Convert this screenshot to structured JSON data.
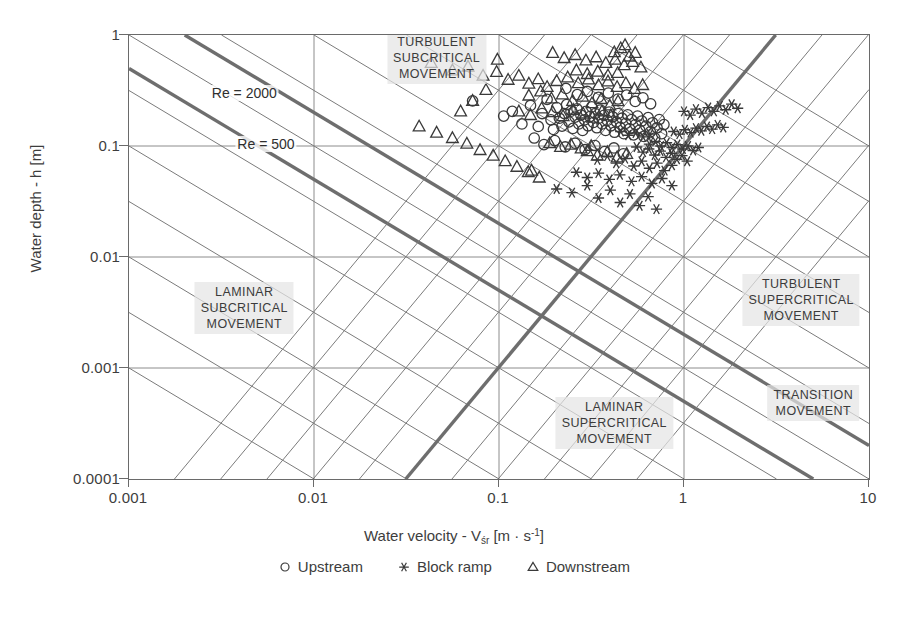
{
  "chart_data": {
    "type": "scatter",
    "title": "",
    "xlabel": "Water velocity - Vśr [m · s⁻¹]",
    "xlabel_parts": {
      "prefix": "Water velocity - V",
      "sub": "śr",
      "mid": " [m · s",
      "sup": "-1",
      "suffix": "]"
    },
    "ylabel": "Water depth - h [m]",
    "xscale": "log",
    "yscale": "log",
    "xlim": [
      0.001,
      10
    ],
    "ylim": [
      0.0001,
      1
    ],
    "xticks": [
      "0.001",
      "0.01",
      "0.1",
      "1",
      "10"
    ],
    "xtick_values": [
      0.001,
      0.01,
      0.1,
      1,
      10
    ],
    "yticks": [
      "1",
      "0.1",
      "0.01",
      "0.001",
      "0.0001"
    ],
    "ytick_values": [
      1,
      0.1,
      0.01,
      0.001,
      0.0001
    ],
    "grid": true,
    "legend_position": "bottom-center",
    "legend": [
      {
        "label": "Upstream",
        "marker": "circle"
      },
      {
        "label": "Block ramp",
        "marker": "asterisk"
      },
      {
        "label": "Downstream",
        "marker": "triangle"
      }
    ],
    "line_labels": [
      {
        "text": "Re = 2000",
        "x": 0.0042,
        "y": 0.3
      },
      {
        "text": "Re = 500",
        "x": 0.0055,
        "y": 0.105
      },
      {
        "text": "Fr = 1",
        "x": 0.035,
        "y": 8.2e-05
      }
    ],
    "zone_labels": [
      {
        "text": "TURBULENT\nSUBCRITICAL\nMOVEMENT",
        "x": 0.046,
        "y": 0.62
      },
      {
        "text": "LAMINAR\nSUBCRITICAL\nMOVEMENT",
        "x": 0.0042,
        "y": 0.0035
      },
      {
        "text": "TURBULENT\nSUPERCRITICAL\nMOVEMENT",
        "x": 4.3,
        "y": 0.0041
      },
      {
        "text": "LAMINAR\nSUPERCRITICAL\nMOVEMENT",
        "x": 0.42,
        "y": 0.00032
      },
      {
        "text": "TRANSITION\nMOVEMENT",
        "x": 5.0,
        "y": 0.00048
      }
    ],
    "series": [
      {
        "name": "Upstream",
        "marker": "circle",
        "points": [
          [
            0.072,
            0.255
          ],
          [
            0.106,
            0.186
          ],
          [
            0.118,
            0.205
          ],
          [
            0.133,
            0.158
          ],
          [
            0.148,
            0.232
          ],
          [
            0.163,
            0.15
          ],
          [
            0.171,
            0.196
          ],
          [
            0.182,
            0.263
          ],
          [
            0.191,
            0.172
          ],
          [
            0.197,
            0.141
          ],
          [
            0.205,
            0.222
          ],
          [
            0.212,
            0.178
          ],
          [
            0.219,
            0.151
          ],
          [
            0.226,
            0.196
          ],
          [
            0.232,
            0.236
          ],
          [
            0.239,
            0.165
          ],
          [
            0.245,
            0.206
          ],
          [
            0.251,
            0.144
          ],
          [
            0.258,
            0.182
          ],
          [
            0.264,
            0.216
          ],
          [
            0.27,
            0.158
          ],
          [
            0.277,
            0.19
          ],
          [
            0.283,
            0.138
          ],
          [
            0.29,
            0.172
          ],
          [
            0.296,
            0.205
          ],
          [
            0.303,
            0.152
          ],
          [
            0.31,
            0.184
          ],
          [
            0.317,
            0.225
          ],
          [
            0.324,
            0.163
          ],
          [
            0.331,
            0.196
          ],
          [
            0.338,
            0.146
          ],
          [
            0.346,
            0.178
          ],
          [
            0.353,
            0.211
          ],
          [
            0.361,
            0.158
          ],
          [
            0.369,
            0.189
          ],
          [
            0.377,
            0.138
          ],
          [
            0.385,
            0.17
          ],
          [
            0.394,
            0.202
          ],
          [
            0.403,
            0.152
          ],
          [
            0.412,
            0.183
          ],
          [
            0.421,
            0.133
          ],
          [
            0.431,
            0.165
          ],
          [
            0.441,
            0.196
          ],
          [
            0.451,
            0.147
          ],
          [
            0.462,
            0.178
          ],
          [
            0.473,
            0.129
          ],
          [
            0.484,
            0.16
          ],
          [
            0.496,
            0.191
          ],
          [
            0.508,
            0.143
          ],
          [
            0.521,
            0.173
          ],
          [
            0.534,
            0.126
          ],
          [
            0.547,
            0.156
          ],
          [
            0.561,
            0.186
          ],
          [
            0.576,
            0.139
          ],
          [
            0.591,
            0.168
          ],
          [
            0.607,
            0.122
          ],
          [
            0.623,
            0.151
          ],
          [
            0.64,
            0.18
          ],
          [
            0.658,
            0.134
          ],
          [
            0.676,
            0.162
          ],
          [
            0.695,
            0.118
          ],
          [
            0.715,
            0.146
          ],
          [
            0.735,
            0.173
          ],
          [
            0.757,
            0.129
          ],
          [
            0.779,
            0.156
          ],
          [
            0.23,
            0.33
          ],
          [
            0.265,
            0.29
          ],
          [
            0.3,
            0.31
          ],
          [
            0.345,
            0.275
          ],
          [
            0.39,
            0.3
          ],
          [
            0.44,
            0.265
          ],
          [
            0.49,
            0.288
          ],
          [
            0.545,
            0.252
          ],
          [
            0.6,
            0.272
          ],
          [
            0.66,
            0.24
          ],
          [
            0.155,
            0.118
          ],
          [
            0.175,
            0.103
          ],
          [
            0.2,
            0.112
          ],
          [
            0.228,
            0.098
          ],
          [
            0.258,
            0.106
          ],
          [
            0.292,
            0.093
          ],
          [
            0.33,
            0.101
          ],
          [
            0.372,
            0.089
          ],
          [
            0.418,
            0.096
          ],
          [
            0.47,
            0.085
          ]
        ]
      },
      {
        "name": "Block ramp",
        "marker": "asterisk",
        "points": [
          [
            0.205,
            0.041
          ],
          [
            0.248,
            0.038
          ],
          [
            0.3,
            0.044
          ],
          [
            0.345,
            0.034
          ],
          [
            0.4,
            0.04
          ],
          [
            0.452,
            0.031
          ],
          [
            0.51,
            0.037
          ],
          [
            0.575,
            0.029
          ],
          [
            0.64,
            0.035
          ],
          [
            0.71,
            0.027
          ],
          [
            0.34,
            0.075
          ],
          [
            0.385,
            0.081
          ],
          [
            0.43,
            0.07
          ],
          [
            0.48,
            0.077
          ],
          [
            0.535,
            0.066
          ],
          [
            0.59,
            0.073
          ],
          [
            0.65,
            0.063
          ],
          [
            0.715,
            0.07
          ],
          [
            0.785,
            0.06
          ],
          [
            0.86,
            0.067
          ],
          [
            0.555,
            0.098
          ],
          [
            0.6,
            0.088
          ],
          [
            0.645,
            0.094
          ],
          [
            0.695,
            0.083
          ],
          [
            0.745,
            0.09
          ],
          [
            0.8,
            0.079
          ],
          [
            0.855,
            0.086
          ],
          [
            0.915,
            0.076
          ],
          [
            0.975,
            0.082
          ],
          [
            1.04,
            0.073
          ],
          [
            0.65,
            0.104
          ],
          [
            0.7,
            0.11
          ],
          [
            0.75,
            0.1
          ],
          [
            0.805,
            0.107
          ],
          [
            0.862,
            0.097
          ],
          [
            0.92,
            0.103
          ],
          [
            0.985,
            0.094
          ],
          [
            1.05,
            0.1
          ],
          [
            1.12,
            0.091
          ],
          [
            1.195,
            0.097
          ],
          [
            0.88,
            0.135
          ],
          [
            0.945,
            0.128
          ],
          [
            1.01,
            0.14
          ],
          [
            1.085,
            0.132
          ],
          [
            1.16,
            0.145
          ],
          [
            1.24,
            0.137
          ],
          [
            1.33,
            0.15
          ],
          [
            1.42,
            0.142
          ],
          [
            1.52,
            0.155
          ],
          [
            1.63,
            0.147
          ],
          [
            1.0,
            0.205
          ],
          [
            1.08,
            0.19
          ],
          [
            1.16,
            0.215
          ],
          [
            1.25,
            0.198
          ],
          [
            1.35,
            0.222
          ],
          [
            1.45,
            0.205
          ],
          [
            1.56,
            0.23
          ],
          [
            1.68,
            0.212
          ],
          [
            1.81,
            0.238
          ],
          [
            1.95,
            0.219
          ],
          [
            0.455,
            0.135
          ],
          [
            0.5,
            0.125
          ],
          [
            0.548,
            0.131
          ],
          [
            0.6,
            0.121
          ],
          [
            0.655,
            0.128
          ],
          [
            0.262,
            0.058
          ],
          [
            0.3,
            0.052
          ],
          [
            0.345,
            0.057
          ],
          [
            0.395,
            0.05
          ],
          [
            0.45,
            0.055
          ],
          [
            0.52,
            0.048
          ],
          [
            0.59,
            0.053
          ],
          [
            0.67,
            0.046
          ],
          [
            0.76,
            0.051
          ],
          [
            0.86,
            0.044
          ]
        ]
      },
      {
        "name": "Downstream",
        "marker": "triangle",
        "points": [
          [
            0.043,
            0.56
          ],
          [
            0.056,
            0.48
          ],
          [
            0.068,
            0.52
          ],
          [
            0.082,
            0.43
          ],
          [
            0.097,
            0.465
          ],
          [
            0.112,
            0.395
          ],
          [
            0.128,
            0.43
          ],
          [
            0.145,
            0.365
          ],
          [
            0.163,
            0.4
          ],
          [
            0.182,
            0.34
          ],
          [
            0.037,
            0.15
          ],
          [
            0.046,
            0.132
          ],
          [
            0.056,
            0.118
          ],
          [
            0.067,
            0.105
          ],
          [
            0.079,
            0.092
          ],
          [
            0.093,
            0.082
          ],
          [
            0.108,
            0.073
          ],
          [
            0.125,
            0.065
          ],
          [
            0.144,
            0.058
          ],
          [
            0.165,
            0.052
          ],
          [
            0.195,
            0.69
          ],
          [
            0.225,
            0.62
          ],
          [
            0.258,
            0.66
          ],
          [
            0.295,
            0.59
          ],
          [
            0.335,
            0.63
          ],
          [
            0.378,
            0.56
          ],
          [
            0.425,
            0.6
          ],
          [
            0.475,
            0.535
          ],
          [
            0.528,
            0.572
          ],
          [
            0.585,
            0.51
          ],
          [
            0.145,
            0.285
          ],
          [
            0.168,
            0.31
          ],
          [
            0.192,
            0.268
          ],
          [
            0.22,
            0.292
          ],
          [
            0.25,
            0.255
          ],
          [
            0.283,
            0.278
          ],
          [
            0.318,
            0.243
          ],
          [
            0.356,
            0.265
          ],
          [
            0.397,
            0.232
          ],
          [
            0.44,
            0.253
          ],
          [
            0.205,
            0.385
          ],
          [
            0.235,
            0.415
          ],
          [
            0.268,
            0.368
          ],
          [
            0.305,
            0.398
          ],
          [
            0.345,
            0.353
          ],
          [
            0.388,
            0.382
          ],
          [
            0.435,
            0.34
          ],
          [
            0.485,
            0.368
          ],
          [
            0.54,
            0.327
          ],
          [
            0.598,
            0.354
          ],
          [
            0.128,
            0.205
          ],
          [
            0.148,
            0.19
          ],
          [
            0.17,
            0.218
          ],
          [
            0.195,
            0.202
          ],
          [
            0.222,
            0.186
          ],
          [
            0.252,
            0.212
          ],
          [
            0.285,
            0.196
          ],
          [
            0.32,
            0.18
          ],
          [
            0.36,
            0.205
          ],
          [
            0.402,
            0.189
          ],
          [
            0.262,
            0.48
          ],
          [
            0.3,
            0.445
          ],
          [
            0.342,
            0.468
          ],
          [
            0.388,
            0.432
          ],
          [
            0.438,
            0.455
          ],
          [
            0.3,
            0.09
          ],
          [
            0.34,
            0.082
          ],
          [
            0.385,
            0.088
          ],
          [
            0.435,
            0.079
          ],
          [
            0.49,
            0.085
          ],
          [
            0.188,
            0.106
          ],
          [
            0.215,
            0.098
          ],
          [
            0.245,
            0.103
          ],
          [
            0.278,
            0.095
          ],
          [
            0.315,
            0.1
          ],
          [
            0.455,
            0.76
          ],
          [
            0.42,
            0.7
          ],
          [
            0.48,
            0.81
          ],
          [
            0.505,
            0.64
          ],
          [
            0.545,
            0.69
          ],
          [
            0.098,
            0.6
          ],
          [
            0.085,
            0.32
          ],
          [
            0.072,
            0.255
          ],
          [
            0.062,
            0.205
          ],
          [
            0.15,
            0.06
          ]
        ]
      }
    ]
  }
}
